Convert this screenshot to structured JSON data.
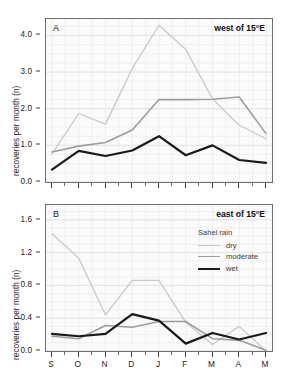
{
  "figure": {
    "width": 281,
    "height": 383,
    "background": "#ffffff",
    "plot_background": "#fbfbfb",
    "frame_color": "#6e6e6e"
  },
  "series_colors": {
    "dry": "#c9c9c9",
    "moderate": "#9d9d9d",
    "wet": "#1a1a1a"
  },
  "legend": {
    "title": "Sahel rain",
    "position": "inside-top-right",
    "entries": [
      {
        "label": "dry",
        "color": "#c9c9c9",
        "width": 1.3
      },
      {
        "label": "moderate",
        "color": "#9d9d9d",
        "width": 1.6
      },
      {
        "label": "wet",
        "color": "#1a1a1a",
        "width": 2.2
      }
    ]
  },
  "chart_data": [
    {
      "type": "line",
      "panel": "A",
      "panel_letter": "A",
      "title": "west of 15°E",
      "xlabel": "",
      "ylabel": "recoveries per month (n)",
      "categories": [
        "S",
        "O",
        "N",
        "D",
        "J",
        "F",
        "M",
        "A",
        "M"
      ],
      "xticklabels": [
        "S",
        "O",
        "N",
        "D",
        "J",
        "F",
        "M",
        "A",
        "M"
      ],
      "yticks": [
        0.0,
        1.0,
        2.0,
        3.0,
        4.0
      ],
      "yticklabels": [
        "0.0",
        "1.0",
        "2.0",
        "3.0",
        "4.0"
      ],
      "ylim": [
        0.0,
        4.45
      ],
      "grid": true,
      "series": [
        {
          "name": "dry",
          "color": "#c9c9c9",
          "values": [
            0.77,
            1.87,
            1.58,
            3.1,
            4.28,
            3.62,
            2.27,
            1.55,
            1.18
          ]
        },
        {
          "name": "moderate",
          "color": "#9d9d9d",
          "values": [
            0.82,
            0.98,
            1.08,
            1.42,
            2.25,
            2.25,
            2.26,
            2.32,
            1.32
          ]
        },
        {
          "name": "wet",
          "color": "#1a1a1a",
          "values": [
            0.34,
            0.85,
            0.71,
            0.86,
            1.25,
            0.73,
            1.0,
            0.6,
            0.52
          ]
        }
      ]
    },
    {
      "type": "line",
      "panel": "B",
      "panel_letter": "B",
      "title": "east of 15°E",
      "xlabel": "",
      "ylabel": "recoveries per month (n)",
      "categories": [
        "S",
        "O",
        "N",
        "D",
        "J",
        "F",
        "M",
        "A",
        "M"
      ],
      "xticklabels": [
        "S",
        "O",
        "N",
        "D",
        "J",
        "F",
        "M",
        "A",
        "M"
      ],
      "yticks": [
        0.0,
        0.4,
        0.8,
        1.2,
        1.6
      ],
      "yticklabels": [
        "0.0",
        "0.4",
        "0.8",
        "1.2",
        "1.6"
      ],
      "ylim": [
        0.0,
        1.78
      ],
      "grid": true,
      "series": [
        {
          "name": "dry",
          "color": "#c9c9c9",
          "values": [
            1.43,
            1.13,
            0.44,
            0.86,
            0.86,
            0.35,
            0.08,
            0.3,
            0.0
          ]
        },
        {
          "name": "moderate",
          "color": "#9d9d9d",
          "values": [
            0.18,
            0.15,
            0.31,
            0.29,
            0.36,
            0.36,
            0.15,
            0.13,
            0.01
          ]
        },
        {
          "name": "wet",
          "color": "#1a1a1a",
          "values": [
            0.21,
            0.18,
            0.21,
            0.45,
            0.37,
            0.09,
            0.22,
            0.14,
            0.22
          ]
        }
      ]
    }
  ]
}
